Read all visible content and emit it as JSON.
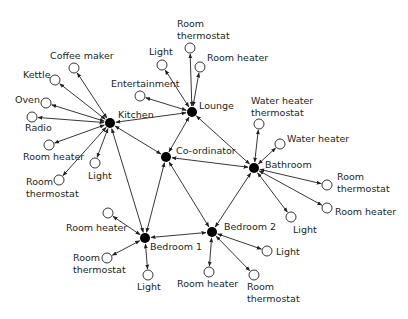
{
  "diagram": {
    "type": "network",
    "colors": {
      "line": "#231f20",
      "hub": "#000000",
      "device_fill": "#ffffff",
      "text": "#231f20"
    },
    "hubs": [
      {
        "id": "kitchen",
        "label": "Kitchen",
        "x": 110,
        "y": 123,
        "lx": 118,
        "ly": 118
      },
      {
        "id": "lounge",
        "label": "Lounge",
        "x": 192,
        "y": 112,
        "lx": 199,
        "ly": 109
      },
      {
        "id": "coordinator",
        "label": "Co-ordinator",
        "x": 166,
        "y": 157,
        "lx": 176,
        "ly": 154
      },
      {
        "id": "bathroom",
        "label": "Bathroom",
        "x": 254,
        "y": 168,
        "lx": 265,
        "ly": 168
      },
      {
        "id": "bedroom1",
        "label": "Bedroom 1",
        "x": 145,
        "y": 238,
        "lx": 150,
        "ly": 250
      },
      {
        "id": "bedroom2",
        "label": "Bedroom 2",
        "x": 212,
        "y": 232,
        "lx": 224,
        "ly": 230
      }
    ],
    "hub_links": [
      [
        "kitchen",
        "lounge"
      ],
      [
        "kitchen",
        "coordinator"
      ],
      [
        "kitchen",
        "bedroom1"
      ],
      [
        "lounge",
        "coordinator"
      ],
      [
        "lounge",
        "bathroom"
      ],
      [
        "coordinator",
        "bathroom"
      ],
      [
        "coordinator",
        "bedroom1"
      ],
      [
        "coordinator",
        "bedroom2"
      ],
      [
        "bathroom",
        "bedroom2"
      ],
      [
        "bedroom1",
        "bedroom2"
      ]
    ],
    "devices": [
      {
        "hub": "kitchen",
        "label": [
          "Coffee maker"
        ],
        "x": 74,
        "y": 68,
        "lx": 50,
        "ly": 59
      },
      {
        "hub": "kitchen",
        "label": [
          "Kettle"
        ],
        "x": 55,
        "y": 80,
        "lx": 23,
        "ly": 78
      },
      {
        "hub": "kitchen",
        "label": [
          "Oven"
        ],
        "x": 46,
        "y": 103,
        "lx": 15,
        "ly": 103
      },
      {
        "hub": "kitchen",
        "label": [
          "Radio"
        ],
        "x": 32,
        "y": 117,
        "lx": 25,
        "ly": 131
      },
      {
        "hub": "kitchen",
        "label": [
          "Room heater"
        ],
        "x": 49,
        "y": 145,
        "lx": 23,
        "ly": 160
      },
      {
        "hub": "kitchen",
        "label": [
          "Room",
          "thermostat"
        ],
        "x": 59,
        "y": 180,
        "lx": 26,
        "ly": 185
      },
      {
        "hub": "kitchen",
        "label": [
          "Light"
        ],
        "x": 95,
        "y": 163,
        "lx": 88,
        "ly": 179
      },
      {
        "hub": "lounge",
        "label": [
          "Light"
        ],
        "x": 162,
        "y": 65,
        "lx": 149,
        "ly": 55
      },
      {
        "hub": "lounge",
        "label": [
          "Room",
          "thermostat"
        ],
        "x": 190,
        "y": 48,
        "lx": 177,
        "ly": 27
      },
      {
        "hub": "lounge",
        "label": [
          "Room heater"
        ],
        "x": 200,
        "y": 67,
        "lx": 207,
        "ly": 61
      },
      {
        "hub": "lounge",
        "label": [
          "Entertainment"
        ],
        "x": 140,
        "y": 96,
        "lx": 111,
        "ly": 87
      },
      {
        "hub": "bathroom",
        "label": [
          "Water heater",
          "thermostat"
        ],
        "x": 259,
        "y": 124,
        "lx": 251,
        "ly": 104
      },
      {
        "hub": "bathroom",
        "label": [
          "Water heater"
        ],
        "x": 280,
        "y": 144,
        "lx": 287,
        "ly": 142
      },
      {
        "hub": "bathroom",
        "label": [
          "Room",
          "thermostat"
        ],
        "x": 327,
        "y": 185,
        "lx": 337,
        "ly": 180
      },
      {
        "hub": "bathroom",
        "label": [
          "Room heater"
        ],
        "x": 327,
        "y": 208,
        "lx": 335,
        "ly": 215
      },
      {
        "hub": "bathroom",
        "label": [
          "Light"
        ],
        "x": 291,
        "y": 217,
        "lx": 293,
        "ly": 233
      },
      {
        "hub": "bedroom1",
        "label": [
          "Room heater"
        ],
        "x": 108,
        "y": 213,
        "lx": 66,
        "ly": 231
      },
      {
        "hub": "bedroom1",
        "label": [
          "Room",
          "thermostat"
        ],
        "x": 107,
        "y": 258,
        "lx": 73,
        "ly": 261
      },
      {
        "hub": "bedroom1",
        "label": [
          "Light"
        ],
        "x": 148,
        "y": 275,
        "lx": 137,
        "ly": 290
      },
      {
        "hub": "bedroom2",
        "label": [
          "Room heater"
        ],
        "x": 209,
        "y": 272,
        "lx": 177,
        "ly": 287
      },
      {
        "hub": "bedroom2",
        "label": [
          "Light"
        ],
        "x": 267,
        "y": 251,
        "lx": 276,
        "ly": 255
      },
      {
        "hub": "bedroom2",
        "label": [
          "Room",
          "thermostat"
        ],
        "x": 254,
        "y": 275,
        "lx": 247,
        "ly": 290
      }
    ]
  }
}
